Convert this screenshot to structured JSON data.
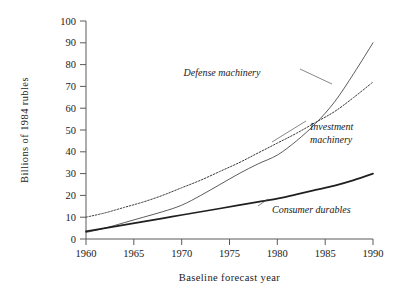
{
  "chart_data": {
    "type": "line",
    "title": "",
    "xlabel": "Baseline forecast year",
    "ylabel": "Billions of 1984 rubles",
    "xlim": [
      1960,
      1990
    ],
    "ylim": [
      0,
      100
    ],
    "grid": false,
    "legend_position": "inline-annotations",
    "xticks": [
      "1960",
      "1965",
      "1970",
      "1975",
      "1980",
      "1985",
      "1990"
    ],
    "xtick_values": [
      1960,
      1965,
      1970,
      1975,
      1980,
      1985,
      1990
    ],
    "yticks": [
      "0",
      "10",
      "20",
      "30",
      "40",
      "50",
      "60",
      "70",
      "80",
      "90",
      "100"
    ],
    "ytick_values": [
      0,
      10,
      20,
      30,
      40,
      50,
      60,
      70,
      80,
      90,
      100
    ],
    "x": [
      1960,
      1962,
      1964,
      1966,
      1968,
      1970,
      1972,
      1974,
      1976,
      1978,
      1980,
      1982,
      1984,
      1986,
      1988,
      1990
    ],
    "series": [
      {
        "name": "Defense machinery",
        "style": "thin-solid",
        "color": "#4a4a4a",
        "values": [
          3.0,
          5.0,
          7.5,
          10.0,
          12.5,
          15.5,
          20.0,
          25.0,
          30.0,
          34.5,
          38.5,
          45.0,
          53.0,
          63.0,
          76.0,
          90.0
        ]
      },
      {
        "name": "Investment machinery",
        "style": "dotted",
        "color": "#3a3a3a",
        "values": [
          10.0,
          12.0,
          14.5,
          17.0,
          20.0,
          23.5,
          27.0,
          31.0,
          35.0,
          39.5,
          44.0,
          48.5,
          53.5,
          58.5,
          65.0,
          72.0
        ]
      },
      {
        "name": "Consumer durables",
        "style": "thick-solid",
        "color": "#1f1f1f",
        "values": [
          3.5,
          5.0,
          6.5,
          8.0,
          9.5,
          11.0,
          12.5,
          14.0,
          15.5,
          17.0,
          18.5,
          20.5,
          22.5,
          24.5,
          27.0,
          30.0
        ]
      }
    ],
    "annotations": [
      {
        "text": "Defense machinery",
        "x_px": 222,
        "y_px": 73
      },
      {
        "text_line1": "Investment",
        "text_line2": "machinery",
        "x_px": 310,
        "y_px": 128
      },
      {
        "text": "Consumer durables",
        "x_px": 262,
        "y_px": 211
      }
    ]
  },
  "axis": {
    "ylabel": "Billions of 1984 rubles",
    "xlabel": "Baseline forecast year"
  },
  "labels": {
    "defense": "Defense machinery",
    "investment_line1": "Investment",
    "investment_line2": "machinery",
    "consumer": "Consumer durables"
  },
  "yticks": {
    "t0": "0",
    "t1": "10",
    "t2": "20",
    "t3": "30",
    "t4": "40",
    "t5": "50",
    "t6": "60",
    "t7": "70",
    "t8": "80",
    "t9": "90",
    "t10": "100"
  },
  "xticks": {
    "t0": "1960",
    "t1": "1965",
    "t2": "1970",
    "t3": "1975",
    "t4": "1980",
    "t5": "1985",
    "t6": "1990"
  }
}
